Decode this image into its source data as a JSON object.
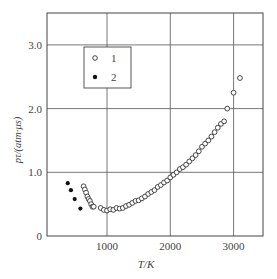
{
  "chart_data": {
    "type": "scatter",
    "title": "",
    "xlabel": "T/K",
    "ylabel": "pτ/(atm·μs)",
    "xlim": [
      0,
      3500
    ],
    "ylim": [
      0,
      3.5
    ],
    "x_ticks": [
      "1000",
      "2000",
      "3000"
    ],
    "y_ticks": [
      "0",
      "1.0",
      "2.0",
      "3.0"
    ],
    "grid": true,
    "legend": {
      "position": "upper-left inset",
      "entries": [
        {
          "marker": "open-circle",
          "label": "1"
        },
        {
          "marker": "filled-circle",
          "label": "2"
        }
      ]
    },
    "series": [
      {
        "name": "1",
        "marker": "open-circle",
        "x": [
          630,
          650,
          670,
          690,
          710,
          730,
          750,
          770,
          790,
          900,
          950,
          1000,
          1050,
          1100,
          1150,
          1200,
          1250,
          1300,
          1350,
          1400,
          1450,
          1500,
          1550,
          1600,
          1650,
          1700,
          1750,
          1800,
          1850,
          1900,
          1950,
          2000,
          2050,
          2100,
          2150,
          2200,
          2250,
          2300,
          2350,
          2400,
          2450,
          2500,
          2550,
          2600,
          2650,
          2700,
          2750,
          2800,
          2850,
          2900,
          3000,
          3100
        ],
        "y": [
          0.78,
          0.73,
          0.68,
          0.62,
          0.58,
          0.55,
          0.5,
          0.46,
          0.46,
          0.44,
          0.41,
          0.4,
          0.42,
          0.41,
          0.44,
          0.43,
          0.44,
          0.47,
          0.49,
          0.52,
          0.55,
          0.56,
          0.59,
          0.62,
          0.66,
          0.69,
          0.72,
          0.77,
          0.8,
          0.84,
          0.87,
          0.92,
          0.96,
          1.0,
          1.05,
          1.08,
          1.12,
          1.17,
          1.22,
          1.27,
          1.33,
          1.4,
          1.45,
          1.5,
          1.56,
          1.63,
          1.7,
          1.76,
          1.8,
          2.0,
          2.25,
          2.48
        ]
      },
      {
        "name": "2",
        "marker": "filled-circle",
        "x": [
          380,
          430,
          490,
          580
        ],
        "y": [
          0.83,
          0.72,
          0.58,
          0.43
        ]
      }
    ]
  }
}
